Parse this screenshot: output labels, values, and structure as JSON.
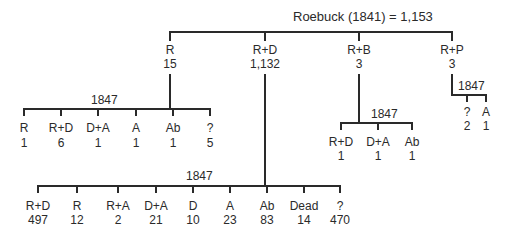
{
  "root": {
    "label": "Roebuck (1841) = 1,153"
  },
  "level1": [
    {
      "label": "R",
      "value": "15"
    },
    {
      "label": "R+D",
      "value": "1,132"
    },
    {
      "label": "R+B",
      "value": "3"
    },
    {
      "label": "R+P",
      "value": "3"
    }
  ],
  "groups": {
    "r": {
      "year": "1847",
      "items": [
        {
          "label": "R",
          "value": "1"
        },
        {
          "label": "R+D",
          "value": "6"
        },
        {
          "label": "D+A",
          "value": "1"
        },
        {
          "label": "A",
          "value": "1"
        },
        {
          "label": "Ab",
          "value": "1"
        },
        {
          "label": "?",
          "value": "5"
        }
      ]
    },
    "rd": {
      "year": "1847",
      "items": [
        {
          "label": "R+D",
          "value": "497"
        },
        {
          "label": "R",
          "value": "12"
        },
        {
          "label": "R+A",
          "value": "2"
        },
        {
          "label": "D+A",
          "value": "21"
        },
        {
          "label": "D",
          "value": "10"
        },
        {
          "label": "A",
          "value": "23"
        },
        {
          "label": "Ab",
          "value": "83"
        },
        {
          "label": "Dead",
          "value": "14"
        },
        {
          "label": "?",
          "value": "470"
        }
      ]
    },
    "rb": {
      "year": "1847",
      "items": [
        {
          "label": "R+D",
          "value": "1"
        },
        {
          "label": "D+A",
          "value": "1"
        },
        {
          "label": "Ab",
          "value": "1"
        }
      ]
    },
    "rp": {
      "year": "1847",
      "items": [
        {
          "label": "?",
          "value": "2"
        },
        {
          "label": "A",
          "value": "1"
        }
      ]
    }
  }
}
